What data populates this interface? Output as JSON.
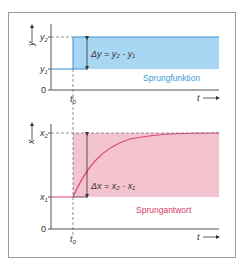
{
  "colors": {
    "step_fill": "#a9d6f2",
    "step_line": "#3a8fd0",
    "step_text": "#3a9ad8",
    "response_fill": "#f4c3d0",
    "response_line": "#d94a70",
    "response_text": "#d63a66",
    "axis": "#555555",
    "dashed": "#777777",
    "frame": "#9a9a9a"
  },
  "top_chart": {
    "y_axis_label": "y",
    "y2_label": "y",
    "y2_sub": "2",
    "y1_label": "y",
    "y1_sub": "1",
    "zero_label": "0",
    "t0_label": "t",
    "t0_sub": "0",
    "t_axis_label": "t",
    "delta_label": "Δy = y₂ - y₁",
    "caption": "Sprungfunktion"
  },
  "bottom_chart": {
    "x_axis_label": "x",
    "x2_label": "x",
    "x2_sub": "2",
    "x1_label": "x",
    "x1_sub": "1",
    "zero_label": "0",
    "t0_label": "t",
    "t0_sub": "0",
    "t_axis_label": "t",
    "delta_label": "Δx = x₂ - x₁",
    "caption": "Sprungantwort"
  }
}
